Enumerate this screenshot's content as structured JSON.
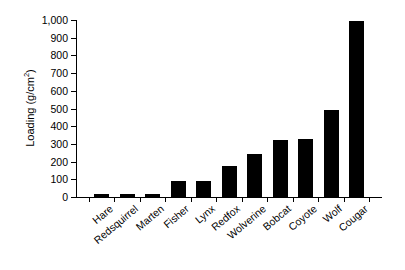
{
  "chart_data": {
    "type": "bar",
    "title": "",
    "subtitle": "",
    "xlabel": "",
    "ylabel": "Loading (g/cm2)",
    "ylabel_parts": {
      "text": "Loading (g/cm",
      "superscript": "2",
      "tail": ")"
    },
    "categories": [
      "Hare",
      "Redsquirrel",
      "Marten",
      "Fisher",
      "Lynx",
      "Redfox",
      "Wolverine",
      "Bobcat",
      "Coyote",
      "Wolf",
      "Cougar"
    ],
    "values": [
      15,
      15,
      18,
      90,
      92,
      175,
      245,
      320,
      325,
      490,
      995
    ],
    "ylim": [
      0,
      1000
    ],
    "ytick_values": [
      0,
      100,
      200,
      300,
      400,
      500,
      600,
      700,
      800,
      900,
      1000
    ],
    "ytick_labels": [
      "0",
      "100",
      "200",
      "300",
      "400",
      "500",
      "600",
      "700",
      "800",
      "900",
      "1,000"
    ],
    "grid": false,
    "legend": false,
    "legend_position": "none",
    "bar_color": "#000000",
    "axis_color": "#000000",
    "background_color": "#ffffff",
    "xtick_label_rotation": -40
  }
}
